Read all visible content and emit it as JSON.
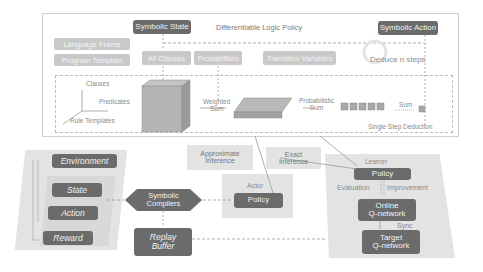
{
  "top_panel": {
    "title": "Differentiable Logic Policy",
    "symbolic_state": "Symbolic State",
    "symbolic_action": "Symbolic Action",
    "language_frame": "Language Frame",
    "program_template": "Program Template",
    "all_clauses": "All Clauses",
    "probabilities": "Probabilities",
    "transition_variables": "Transition Variables",
    "deduce": "Deduce n steps",
    "axes": {
      "clauses": "Clauses",
      "predicates": "Predicates",
      "rule_templates": "Rule Templates"
    },
    "weighted_sum": [
      "Weighted",
      "Sum"
    ],
    "probabilistic_sum": [
      "Probabilistic",
      "Sum"
    ],
    "sum": "Sum",
    "single_step": "Single Step Deduction"
  },
  "environment_group": {
    "environment": "Environment",
    "state": "State",
    "action": "Action",
    "reward": "Reward"
  },
  "symbolic_compilers": [
    "Symbolic",
    "Compilers"
  ],
  "replay_buffer": [
    "Replay",
    "Buffer"
  ],
  "approximate_inference": [
    "Approximate",
    "Inference"
  ],
  "exact_inference": [
    "Exact",
    "Inference"
  ],
  "actor": {
    "title": "Actor",
    "policy": "Policy"
  },
  "learner": {
    "title": "Learner",
    "policy": "Policy",
    "evaluation": "Evaluation",
    "improvement": "Improvement",
    "online_q": [
      "Online",
      "Q-network"
    ],
    "sync": "Sync",
    "target_q": [
      "Target",
      "Q-network"
    ]
  },
  "colors": {
    "dark_box": "#6b6b6b",
    "light_box": "#c9c9c9",
    "panel": "#e3e3e3",
    "line": "#9a9a9a"
  }
}
